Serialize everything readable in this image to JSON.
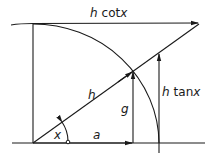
{
  "labels": {
    "top": "h cot x",
    "top_h": "h",
    "top_fn": "cot",
    "top_var": "x",
    "hyp": "h",
    "g": "g",
    "tan_h": "h",
    "tan_fn": "tan",
    "tan_var": "x",
    "angle": "x",
    "a": "a"
  },
  "colors": {
    "stroke": "#1a1a1a",
    "background": "#ffffff"
  }
}
